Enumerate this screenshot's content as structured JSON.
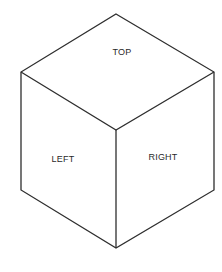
{
  "diagram": {
    "type": "isometric-cube",
    "faces": [
      {
        "id": "top",
        "label": "TOP"
      },
      {
        "id": "left",
        "label": "LEFT"
      },
      {
        "id": "right",
        "label": "RIGHT"
      }
    ],
    "colors": {
      "background": "#ffffff",
      "stroke": "#2e2e2e",
      "text": "#2a2a2a"
    }
  }
}
